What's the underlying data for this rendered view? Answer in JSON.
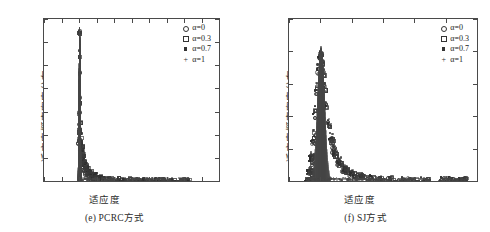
{
  "figure": {
    "panels": [
      {
        "id": "e",
        "caption": "(e) PCRC方式",
        "axis_title_x": "适应度",
        "axis_title_y": "适应度概率密度分布",
        "x_ticks": [
          "-1",
          "-0.5",
          "0",
          "0.5",
          "1",
          "1.5",
          "2",
          "2.5",
          "3",
          "3.5",
          "4"
        ],
        "y_ticks": [
          "0",
          "0.02",
          "0.04",
          "0.06",
          "0.08",
          "0.1",
          "0.12",
          "0.14"
        ],
        "legend": [
          {
            "marker": "circle",
            "label": "α=0"
          },
          {
            "marker": "square",
            "label": "α=0.3"
          },
          {
            "marker": "filled-square",
            "label": "α=0.7"
          },
          {
            "marker": "plus",
            "label": "α=1"
          }
        ]
      },
      {
        "id": "f",
        "caption": "(f) SJ方式",
        "axis_title_x": "适应度",
        "axis_title_y": "适应度概率密度分布",
        "x_ticks": [
          "-1",
          "0",
          "1",
          "2",
          "3",
          "4",
          "5"
        ],
        "y_ticks": [
          "0",
          "0.005",
          "0.01",
          "0.015",
          "0.02",
          "0.025"
        ],
        "legend": [
          {
            "marker": "circle",
            "label": "α=0"
          },
          {
            "marker": "square",
            "label": "α=0.3"
          },
          {
            "marker": "filled-square",
            "label": "α=0.7"
          },
          {
            "marker": "plus",
            "label": "α=1"
          }
        ]
      }
    ]
  },
  "chart_data": [
    {
      "type": "scatter",
      "panel": "e",
      "title": "(e) PCRC方式",
      "xlabel": "适应度",
      "ylabel": "适应度概率密度分布",
      "xlim": [
        -1,
        4
      ],
      "ylim": [
        0,
        0.14
      ],
      "xticks": [
        -1,
        -0.5,
        0,
        0.5,
        1,
        1.5,
        2,
        2.5,
        3,
        3.5,
        4
      ],
      "yticks": [
        0,
        0.02,
        0.04,
        0.06,
        0.08,
        0.1,
        0.12,
        0.14
      ],
      "grid": false,
      "legend_position": "top-right",
      "series": [
        {
          "name": "α=0",
          "marker": "circle",
          "x": [
            0.0,
            0.0,
            0.01,
            -0.01,
            0.0,
            0.02,
            -0.02,
            0.03,
            0.05,
            0.08,
            0.12,
            0.18,
            0.25,
            0.35,
            0.5,
            0.7,
            0.95,
            1.25,
            1.6,
            1.95,
            2.1,
            2.25,
            2.4,
            2.6,
            2.9,
            3.05,
            1.5,
            1.05,
            0.6,
            0.4
          ],
          "y": [
            0.1295,
            0.0945,
            0.073,
            0.06,
            0.0455,
            0.039,
            0.034,
            0.028,
            0.0215,
            0.016,
            0.0115,
            0.008,
            0.0055,
            0.0035,
            0.0022,
            0.0014,
            0.0009,
            0.0006,
            0.0004,
            0.0004,
            0.0003,
            0.0003,
            0.0003,
            0.0002,
            0.0002,
            0.0002,
            0.0004,
            0.0006,
            0.0012,
            0.0028
          ]
        },
        {
          "name": "α=0.3",
          "marker": "square",
          "x": [
            0.0,
            0.0,
            0.0,
            0.01,
            -0.01,
            0.02,
            0.04,
            0.06,
            0.1,
            0.15,
            0.22,
            0.3,
            0.42,
            0.58,
            0.8,
            1.1,
            1.45,
            1.8,
            2.05,
            2.2,
            2.35,
            2.55,
            2.75,
            3.0,
            3.1,
            1.65,
            1.2,
            0.9,
            0.5,
            0.33
          ],
          "y": [
            0.1285,
            0.108,
            0.068,
            0.052,
            0.043,
            0.0365,
            0.03,
            0.0245,
            0.0185,
            0.014,
            0.01,
            0.0072,
            0.0048,
            0.003,
            0.0019,
            0.0012,
            0.0008,
            0.0005,
            0.0004,
            0.0003,
            0.0003,
            0.0002,
            0.0002,
            0.0002,
            0.0002,
            0.0004,
            0.0006,
            0.001,
            0.0021,
            0.0038
          ]
        },
        {
          "name": "α=0.7",
          "marker": "filled-square",
          "x": [
            0.0,
            0.0,
            0.0,
            -0.01,
            0.01,
            0.03,
            0.05,
            0.07,
            0.11,
            0.16,
            0.24,
            0.33,
            0.46,
            0.64,
            0.88,
            1.15,
            1.55,
            1.85,
            2.0,
            2.15,
            2.3,
            2.5,
            2.7,
            2.95,
            3.08,
            1.7,
            1.3,
            0.75,
            0.55,
            0.38
          ],
          "y": [
            0.129,
            0.093,
            0.0855,
            0.058,
            0.047,
            0.04,
            0.033,
            0.027,
            0.02,
            0.015,
            0.0108,
            0.0076,
            0.005,
            0.0032,
            0.002,
            0.0013,
            0.0008,
            0.0005,
            0.0004,
            0.0003,
            0.0003,
            0.0002,
            0.0002,
            0.0002,
            0.0002,
            0.0004,
            0.0007,
            0.0015,
            0.0024,
            0.0033
          ]
        },
        {
          "name": "α=1",
          "marker": "plus",
          "x": [
            0.0,
            0.0,
            0.0,
            0.01,
            -0.01,
            0.02,
            0.04,
            0.06,
            0.09,
            0.14,
            0.2,
            0.28,
            0.38,
            0.52,
            0.72,
            1.0,
            1.35,
            1.75,
            1.9,
            2.05,
            2.28,
            2.45,
            2.65,
            2.85,
            3.02,
            1.58,
            1.12,
            0.82,
            0.45,
            0.3
          ],
          "y": [
            0.13,
            0.1125,
            0.092,
            0.062,
            0.049,
            0.041,
            0.0345,
            0.0285,
            0.021,
            0.0155,
            0.0112,
            0.0078,
            0.0052,
            0.0033,
            0.0021,
            0.0013,
            0.0009,
            0.0005,
            0.0004,
            0.0003,
            0.0003,
            0.0002,
            0.0002,
            0.0002,
            0.0002,
            0.0004,
            0.0006,
            0.0011,
            0.0025,
            0.0042
          ]
        }
      ],
      "notes": "Very sharp unimodal spike centred at fitness = 0, peak density ≈0.13; long sparse low-density tail with clustered baseline points near 1.4-1.7, 1.9-2.5 and 2.9-3.1."
    },
    {
      "type": "scatter",
      "panel": "f",
      "title": "(f) SJ方式",
      "xlabel": "适应度",
      "ylabel": "适应度概率密度分布",
      "xlim": [
        -1,
        5
      ],
      "ylim": [
        0,
        0.025
      ],
      "xticks": [
        -1,
        0,
        1,
        2,
        3,
        4,
        5
      ],
      "yticks": [
        0,
        0.005,
        0.01,
        0.015,
        0.02,
        0.025
      ],
      "grid": false,
      "legend_position": "top-right",
      "series": [
        {
          "name": "α=0",
          "marker": "circle",
          "x": [
            -0.42,
            -0.35,
            -0.3,
            -0.25,
            -0.2,
            -0.15,
            -0.1,
            -0.05,
            0.0,
            0.03,
            0.06,
            0.1,
            0.15,
            0.22,
            0.3,
            0.4,
            0.55,
            0.72,
            0.95,
            1.2,
            1.5,
            1.85,
            2.15,
            2.5,
            2.8,
            3.3,
            3.95,
            4.25,
            4.55,
            4.6
          ],
          "y": [
            0.0002,
            0.0012,
            0.003,
            0.006,
            0.0098,
            0.0135,
            0.0168,
            0.019,
            0.0198,
            0.0186,
            0.017,
            0.0148,
            0.012,
            0.0092,
            0.0068,
            0.0048,
            0.003,
            0.0019,
            0.0012,
            0.0008,
            0.0005,
            0.0004,
            0.0003,
            0.0002,
            0.0002,
            0.0002,
            0.0002,
            0.0002,
            0.0002,
            0.0002
          ]
        },
        {
          "name": "α=0.3",
          "marker": "square",
          "x": [
            -0.4,
            -0.33,
            -0.28,
            -0.23,
            -0.18,
            -0.13,
            -0.08,
            -0.03,
            0.01,
            0.05,
            0.09,
            0.13,
            0.18,
            0.26,
            0.35,
            0.46,
            0.62,
            0.82,
            1.05,
            1.35,
            1.65,
            2.0,
            2.3,
            2.65,
            3.05,
            3.4,
            4.05,
            4.3,
            4.45,
            4.58
          ],
          "y": [
            0.0003,
            0.0016,
            0.0038,
            0.0072,
            0.011,
            0.0145,
            0.0175,
            0.0193,
            0.0196,
            0.0182,
            0.0164,
            0.0142,
            0.0114,
            0.0086,
            0.0062,
            0.0043,
            0.0027,
            0.0017,
            0.0011,
            0.0007,
            0.0005,
            0.0003,
            0.0003,
            0.0002,
            0.0002,
            0.0002,
            0.0002,
            0.0002,
            0.0002,
            0.0002
          ]
        },
        {
          "name": "α=0.7",
          "marker": "filled-square",
          "x": [
            -0.44,
            -0.37,
            -0.31,
            -0.26,
            -0.21,
            -0.16,
            -0.11,
            -0.06,
            -0.01,
            0.02,
            0.07,
            0.11,
            0.16,
            0.24,
            0.32,
            0.44,
            0.58,
            0.78,
            1.0,
            1.28,
            1.58,
            1.92,
            2.22,
            2.58,
            2.95,
            3.25,
            3.85,
            4.15,
            4.4,
            4.5
          ],
          "y": [
            0.0002,
            0.0014,
            0.0034,
            0.0066,
            0.0104,
            0.014,
            0.0172,
            0.0191,
            0.02,
            0.0188,
            0.0168,
            0.0145,
            0.0117,
            0.0089,
            0.0065,
            0.0045,
            0.0029,
            0.0018,
            0.0011,
            0.0007,
            0.0005,
            0.0003,
            0.0003,
            0.0002,
            0.0002,
            0.0002,
            0.0002,
            0.0002,
            0.0002,
            0.0002
          ]
        },
        {
          "name": "α=1",
          "marker": "plus",
          "x": [
            -0.38,
            -0.32,
            -0.27,
            -0.22,
            -0.17,
            -0.12,
            -0.07,
            -0.02,
            0.0,
            0.04,
            0.08,
            0.12,
            0.17,
            0.25,
            0.34,
            0.45,
            0.6,
            0.8,
            1.02,
            1.3,
            1.6,
            1.95,
            2.25,
            2.62,
            3.0,
            3.35,
            3.9,
            4.2,
            4.48,
            4.62
          ],
          "y": [
            0.0003,
            0.0018,
            0.0042,
            0.0078,
            0.0116,
            0.015,
            0.018,
            0.0197,
            0.0205,
            0.019,
            0.0172,
            0.015,
            0.0122,
            0.0094,
            0.007,
            0.005,
            0.0032,
            0.002,
            0.0013,
            0.0008,
            0.0005,
            0.0004,
            0.0003,
            0.0002,
            0.0002,
            0.0002,
            0.0002,
            0.0002,
            0.0002,
            0.0002
          ]
        }
      ],
      "notes": "Broader unimodal peak centred near fitness = 0 with peak density ≈0.0205; distribution spans about -0.45 to 0.6 at appreciable density, with a long thin right tail and isolated baseline clusters near 2.6-3.4 and 3.9-4.6."
    }
  ]
}
